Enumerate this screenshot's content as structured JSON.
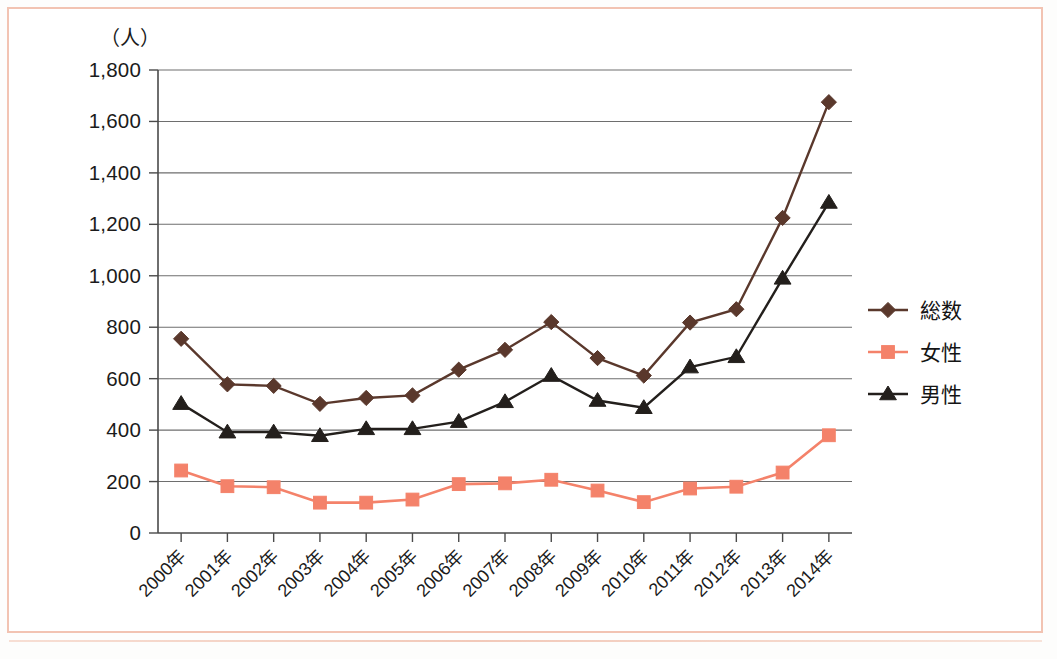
{
  "figure": {
    "border_color": "#f2c3b2",
    "background": "#ffffff"
  },
  "chart_data": {
    "type": "line",
    "title": "",
    "subtitle": "",
    "xlabel": "",
    "ylabel": "",
    "y_unit_label": "（人）",
    "categories": [
      "2000年",
      "2001年",
      "2002年",
      "2003年",
      "2004年",
      "2005年",
      "2006年",
      "2007年",
      "2008年",
      "2009年",
      "2010年",
      "2011年",
      "2012年",
      "2013年",
      "2014年"
    ],
    "x": [
      2000,
      2001,
      2002,
      2003,
      2004,
      2005,
      2006,
      2007,
      2008,
      2009,
      2010,
      2011,
      2012,
      2013,
      2014
    ],
    "ylim": [
      0,
      1800
    ],
    "ytick_step": 200,
    "ytick_labels": [
      "0",
      "200",
      "400",
      "600",
      "800",
      "1,000",
      "1,200",
      "1,400",
      "1,600",
      "1,800"
    ],
    "ytick_values": [
      0,
      200,
      400,
      600,
      800,
      1000,
      1200,
      1400,
      1600,
      1800
    ],
    "grid": true,
    "grid_axis": "y",
    "legend_position": "right",
    "series": [
      {
        "name": "総数",
        "color": "#5a382c",
        "marker": "diamond",
        "values": [
          755,
          578,
          572,
          502,
          525,
          535,
          635,
          712,
          820,
          680,
          612,
          818,
          870,
          1225,
          1675
        ]
      },
      {
        "name": "女性",
        "color": "#f4826a",
        "marker": "square",
        "values": [
          243,
          182,
          178,
          118,
          118,
          130,
          190,
          193,
          207,
          165,
          120,
          173,
          180,
          235,
          380
        ]
      },
      {
        "name": "男性",
        "color": "#231f1c",
        "marker": "triangle",
        "values": [
          503,
          392,
          392,
          378,
          405,
          405,
          433,
          510,
          612,
          515,
          487,
          645,
          685,
          990,
          1285
        ]
      }
    ]
  }
}
